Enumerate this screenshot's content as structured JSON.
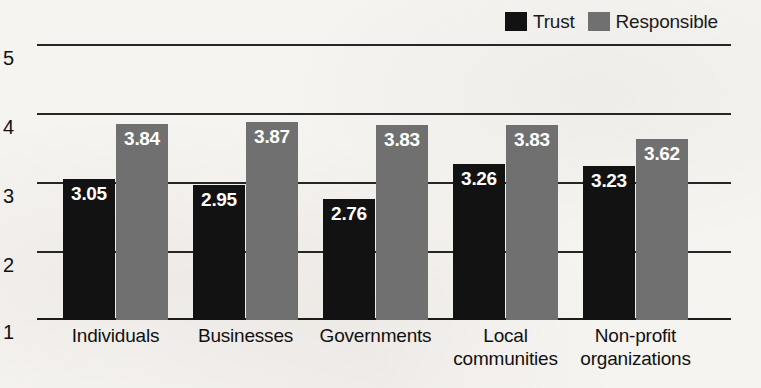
{
  "chart_data": {
    "type": "bar",
    "title": "",
    "xlabel": "",
    "ylabel": "",
    "ylim": [
      1,
      5
    ],
    "yticks": [
      5,
      4,
      3,
      2,
      1
    ],
    "grid": true,
    "legend_position": "top-right",
    "categories": [
      "Individuals",
      "Businesses",
      "Governments",
      "Local communities",
      "Non-profit organizations"
    ],
    "category_lines": [
      [
        "Individuals"
      ],
      [
        "Businesses"
      ],
      [
        "Governments"
      ],
      [
        "Local",
        "communities"
      ],
      [
        "Non-profit",
        "organizations"
      ]
    ],
    "series": [
      {
        "name": "Trust",
        "color": "#121212",
        "values": [
          3.05,
          2.95,
          2.76,
          3.26,
          3.23
        ],
        "labels": [
          "3.05",
          "2.95",
          "2.76",
          "3.26",
          "3.23"
        ]
      },
      {
        "name": "Responsible",
        "color": "#707070",
        "values": [
          3.84,
          3.87,
          3.83,
          3.83,
          3.62
        ],
        "labels": [
          "3.84",
          "3.87",
          "3.83",
          "3.83",
          "3.62"
        ]
      }
    ]
  },
  "legend": {
    "entries": [
      {
        "label": "Trust",
        "color": "#121212",
        "swatch_name": "legend-swatch-trust"
      },
      {
        "label": "Responsible",
        "color": "#707070",
        "swatch_name": "legend-swatch-responsible"
      }
    ]
  },
  "axis": {
    "y_tick_labels": [
      "5",
      "4",
      "3",
      "2",
      "1"
    ]
  }
}
